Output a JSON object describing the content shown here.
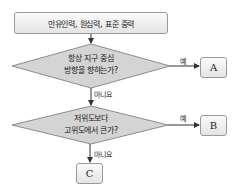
{
  "diagram": {
    "type": "flowchart",
    "start": {
      "label": "만유인력, 원심력, 표준 중력"
    },
    "decisions": [
      {
        "id": "d1",
        "lines": [
          "항상 지구 중심",
          "방향을 향하는가?"
        ],
        "yes_label": "예",
        "no_label": "아니요",
        "yes_target": "A"
      },
      {
        "id": "d2",
        "lines": [
          "저위도보다",
          "고위도에서 큰가?"
        ],
        "yes_label": "예",
        "no_label": "아니요",
        "yes_target": "B",
        "no_target": "C"
      }
    ],
    "terminals": [
      {
        "id": "A",
        "label": "A"
      },
      {
        "id": "B",
        "label": "B"
      },
      {
        "id": "C",
        "label": "C"
      }
    ],
    "colors": {
      "diamond_fill": "#d4d4d4",
      "stroke": "#8c8c8c",
      "box_top": "#fbfbfb",
      "box_bottom": "#e4e4e4"
    }
  }
}
